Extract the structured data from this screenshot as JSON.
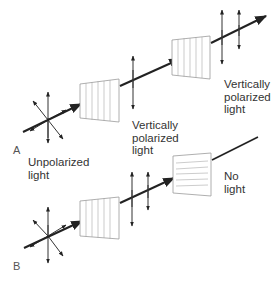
{
  "panels": {
    "A": {
      "letter": "A",
      "label_unpolarized": "Unpolarized\nlight",
      "label_after_first": "Vertically\npolarized\nlight",
      "label_after_second": "Vertically\npolarized\nlight",
      "first_filter_orientation": "vertical",
      "second_filter_orientation": "vertical"
    },
    "B": {
      "letter": "B",
      "label_result": "No\nlight",
      "first_filter_orientation": "vertical",
      "second_filter_orientation": "horizontal"
    }
  },
  "colors": {
    "beam": "#222222",
    "filter_stroke": "#9a9a9a",
    "text": "#333333"
  }
}
